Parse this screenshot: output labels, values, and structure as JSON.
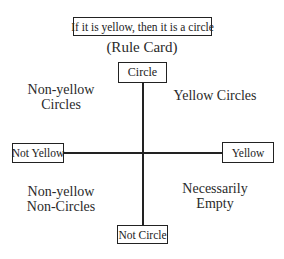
{
  "rule_card": {
    "text": "If it is yellow, then it is a circle",
    "caption": "(Rule Card)"
  },
  "axes": {
    "top": "Circle",
    "bottom": "Not Circle",
    "left": "Not Yellow",
    "right": "Yellow"
  },
  "quadrants": {
    "top_left": [
      "Non-yellow",
      "Circles"
    ],
    "top_right": [
      "Yellow Circles"
    ],
    "bottom_left": [
      "Non-yellow",
      "Non-Circles"
    ],
    "bottom_right": [
      "Necessarily",
      "Empty"
    ]
  }
}
